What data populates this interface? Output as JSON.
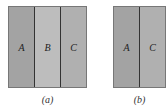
{
  "figures": [
    {
      "caption": "(a)",
      "regions": [
        {
          "label": "A",
          "color": "#a3a3a3"
        },
        {
          "label": "B",
          "color": "#bdbdbd"
        },
        {
          "label": "C",
          "color": "#b0b0b0"
        }
      ]
    },
    {
      "caption": "(b)",
      "regions": [
        {
          "label": "A",
          "color": "#a3a3a3"
        },
        {
          "label": "C",
          "color": "#b0b0b0"
        }
      ]
    }
  ]
}
